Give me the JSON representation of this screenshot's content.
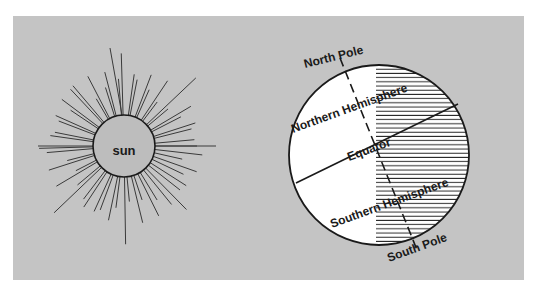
{
  "diagram": {
    "sun": {
      "label": "sun"
    },
    "earth": {
      "labels": {
        "north_pole": "North Pole",
        "south_pole": "South Pole",
        "northern_hemisphere": "Northern Hemisphere",
        "southern_hemisphere": "Southern Hemisphere",
        "equator": "Equator"
      }
    },
    "colors": {
      "background": "#c4c4c4",
      "sun_fill": "#bdbdbd",
      "earth_fill": "#ffffff",
      "line": "#1a1a1a"
    }
  }
}
